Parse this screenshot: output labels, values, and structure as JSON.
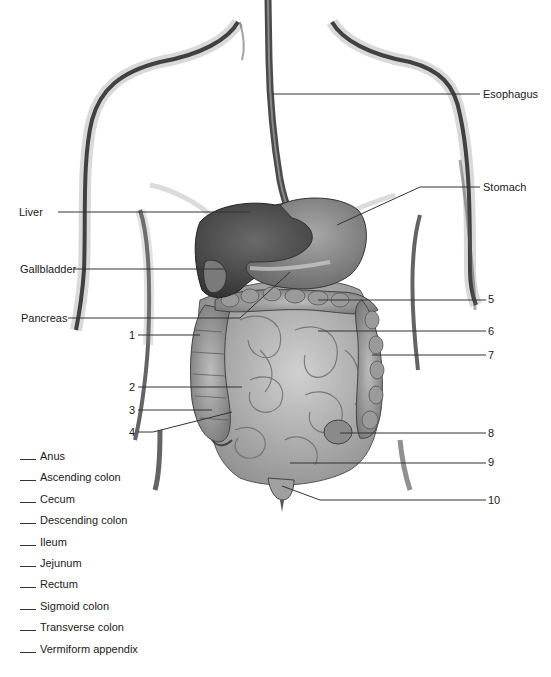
{
  "diagram": {
    "named_labels": [
      {
        "id": "esophagus",
        "text": "Esophagus",
        "side": "right"
      },
      {
        "id": "stomach",
        "text": "Stomach",
        "side": "right"
      },
      {
        "id": "liver",
        "text": "Liver",
        "side": "left"
      },
      {
        "id": "gallbladder",
        "text": "Gallbladder",
        "side": "left"
      },
      {
        "id": "pancreas",
        "text": "Pancreas",
        "side": "left"
      }
    ],
    "numbered_labels": [
      {
        "num": "1",
        "side": "left"
      },
      {
        "num": "2",
        "side": "left"
      },
      {
        "num": "3",
        "side": "left"
      },
      {
        "num": "4",
        "side": "left"
      },
      {
        "num": "5",
        "side": "right"
      },
      {
        "num": "6",
        "side": "right"
      },
      {
        "num": "7",
        "side": "right"
      },
      {
        "num": "8",
        "side": "right"
      },
      {
        "num": "9",
        "side": "right"
      },
      {
        "num": "10",
        "side": "right"
      }
    ],
    "word_bank": [
      "Anus",
      "Ascending colon",
      "Cecum",
      "Descending colon",
      "Ileum",
      "Jejunum",
      "Rectum",
      "Sigmoid colon",
      "Transverse colon",
      "Vermiform appendix"
    ],
    "colors": {
      "liver": "#5a5a5a",
      "stomach": "#8a8a8a",
      "intestine": "#b0b0b0",
      "leader_line": "#333333"
    }
  }
}
